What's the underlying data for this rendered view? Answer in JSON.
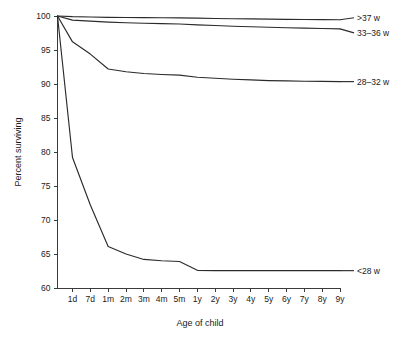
{
  "chart_data": {
    "type": "line",
    "title": "",
    "xlabel": "Age of child",
    "ylabel": "Percent surviving",
    "ylim": [
      60,
      100
    ],
    "yticks": [
      60,
      65,
      70,
      75,
      80,
      85,
      90,
      95,
      100
    ],
    "ytick_labels": [
      "60",
      "65",
      "70",
      "75",
      "80",
      "85",
      "90",
      "95",
      "100"
    ],
    "grid": false,
    "legend_position": "right-inline-labels",
    "x": [
      "1d",
      "7d",
      "1m",
      "2m",
      "3m",
      "4m",
      "5m",
      "1y",
      "2y",
      "3y",
      "4y",
      "5y",
      "6y",
      "7y",
      "8y",
      "9y"
    ],
    "xtick_labels": [
      "1d",
      "7d",
      "1m",
      "2m",
      "3m",
      "4m",
      "5m",
      "1y",
      "2y",
      "3y",
      "4y",
      "5y",
      "6y",
      "7y",
      "8y",
      "9y"
    ],
    "series": [
      {
        "name": ">37 w",
        "label": ">37 w",
        "values": [
          99.9,
          99.85,
          99.8,
          99.78,
          99.76,
          99.74,
          99.72,
          99.68,
          99.64,
          99.6,
          99.57,
          99.54,
          99.51,
          99.49,
          99.47,
          99.45
        ]
      },
      {
        "name": "33–36 w",
        "label": "33–36 w",
        "values": [
          99.4,
          99.25,
          99.1,
          99.0,
          98.93,
          98.87,
          98.82,
          98.7,
          98.6,
          98.5,
          98.42,
          98.35,
          98.28,
          98.22,
          98.16,
          98.1
        ]
      },
      {
        "name": "28–32 w",
        "label": "28–32 w",
        "values": [
          96.2,
          94.4,
          92.2,
          91.8,
          91.55,
          91.4,
          91.3,
          91.0,
          90.85,
          90.7,
          90.6,
          90.5,
          90.45,
          90.4,
          90.38,
          90.35
        ]
      },
      {
        "name": "<28 w",
        "label": "<28 w",
        "values": [
          79.2,
          72.2,
          66.1,
          65.0,
          64.2,
          64.0,
          63.9,
          62.6,
          62.55,
          62.55,
          62.55,
          62.55,
          62.55,
          62.55,
          62.55,
          62.55
        ]
      }
    ],
    "series_start_value": 100
  }
}
